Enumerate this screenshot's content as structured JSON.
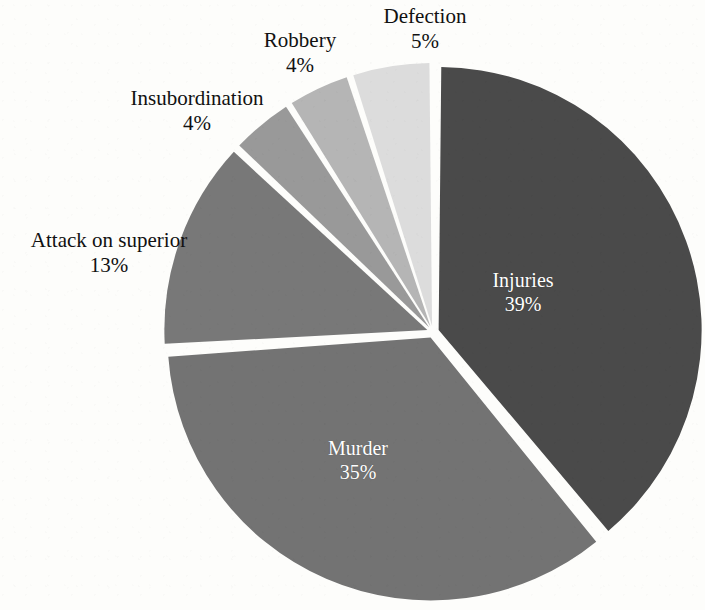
{
  "chart_data": {
    "type": "pie",
    "title": "",
    "subtitle": "",
    "xlabel": "",
    "ylabel": "",
    "legend_position": "none",
    "grid": false,
    "start_angle_deg": 0,
    "direction": "clockwise",
    "value_unit": "percent",
    "categories": [
      "Injuries",
      "Murder",
      "Attack on superior",
      "Insubordination",
      "Robbery",
      "Defection"
    ],
    "values": [
      39,
      35,
      13,
      4,
      4,
      5
    ],
    "slices": [
      {
        "id": "injuries",
        "label": "Injuries",
        "value": 39,
        "value_text": "39%",
        "color": "#4a4a4a",
        "label_placement": "inside",
        "label_color": "#ffffff",
        "exploded": true
      },
      {
        "id": "murder",
        "label": "Murder",
        "value": 35,
        "value_text": "35%",
        "color": "#737373",
        "label_placement": "inside",
        "label_color": "#ffffff",
        "exploded": true
      },
      {
        "id": "attack-on-superior",
        "label": "Attack on superior",
        "value": 13,
        "value_text": "13%",
        "color": "#787878",
        "label_placement": "outside",
        "label_color": "#111111",
        "exploded": true
      },
      {
        "id": "insubordination",
        "label": "Insubordination",
        "value": 4,
        "value_text": "4%",
        "color": "#999999",
        "label_placement": "outside",
        "label_color": "#111111",
        "exploded": true
      },
      {
        "id": "robbery",
        "label": "Robbery",
        "value": 4,
        "value_text": "4%",
        "color": "#b5b5b5",
        "label_placement": "outside",
        "label_color": "#111111",
        "exploded": true
      },
      {
        "id": "defection",
        "label": "Defection",
        "value": 5,
        "value_text": "5%",
        "color": "#dcdcdc",
        "label_placement": "outside",
        "label_color": "#111111",
        "exploded": true
      }
    ],
    "geometry": {
      "center_x": 433,
      "center_y": 332,
      "radius": 263,
      "gap_color": "#ffffff"
    },
    "background_color": "#fdfdfb"
  }
}
